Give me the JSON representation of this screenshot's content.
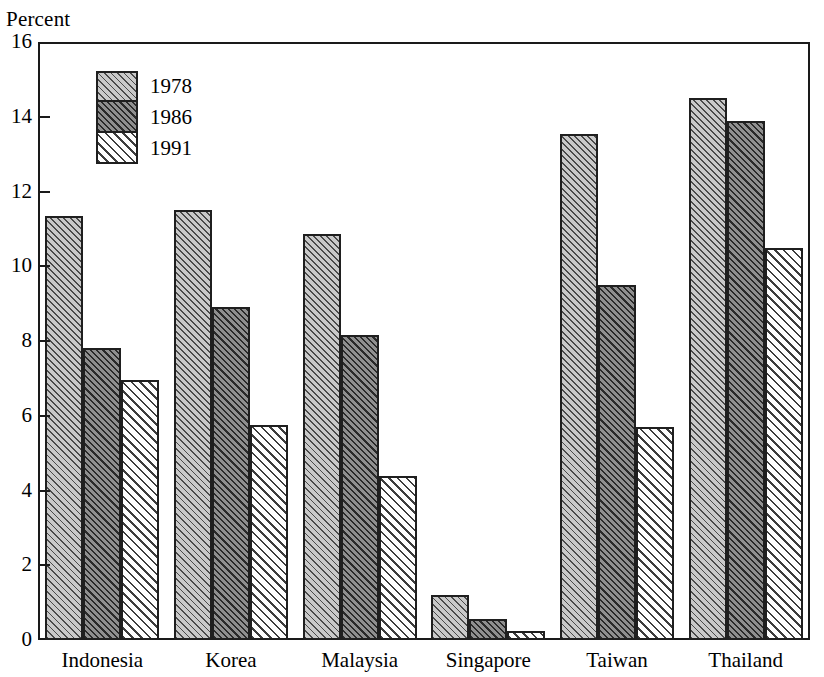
{
  "chart_data": {
    "type": "bar",
    "title": "",
    "subtitle": "",
    "xlabel": "",
    "ylabel": "Percent",
    "ylim": [
      0,
      16
    ],
    "yticks": [
      0,
      2,
      4,
      6,
      8,
      10,
      12,
      14,
      16
    ],
    "ytick_labels": [
      "0",
      "2",
      "4",
      "6",
      "8",
      "10",
      "12",
      "14",
      "16"
    ],
    "grid": false,
    "legend_position": "top-left inside plot",
    "categories": [
      "Indonesia",
      "Korea",
      "Malaysia",
      "Singapore",
      "Taiwan",
      "Thailand"
    ],
    "series": [
      {
        "name": "1978",
        "values": [
          11.35,
          11.5,
          10.85,
          1.2,
          13.55,
          14.5
        ]
      },
      {
        "name": "1986",
        "values": [
          7.8,
          8.9,
          8.15,
          0.55,
          9.5,
          13.9
        ]
      },
      {
        "name": "1991",
        "values": [
          6.95,
          5.75,
          4.4,
          0.25,
          5.7,
          10.5
        ]
      }
    ],
    "annotations": []
  },
  "legend": {
    "entries": [
      {
        "label": "1978",
        "swatch": "light-gray-hatch"
      },
      {
        "label": "1986",
        "swatch": "dark-gray-hatch"
      },
      {
        "label": "1991",
        "swatch": "white-hatch"
      }
    ]
  },
  "colors": {
    "axis": "#1a1a1a",
    "bar_outline": "#1f1f1f",
    "fill_1978": "#c9c9c9",
    "fill_1986": "#8f8f8f",
    "fill_1991": "#fefefe",
    "background": "#ffffff"
  }
}
